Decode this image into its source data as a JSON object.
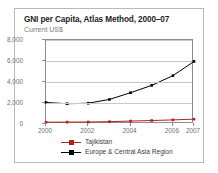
{
  "chart_data": {
    "type": "line",
    "title": "GNI per Capita, Atlas Method, 2000–07",
    "subtitle": "Current US$",
    "xlabel": "",
    "ylabel": "",
    "x": [
      2000,
      2001,
      2002,
      2003,
      2004,
      2005,
      2006,
      2007
    ],
    "xlim": [
      2000,
      2007
    ],
    "ylim": [
      0,
      8000
    ],
    "yticks": [
      0,
      2000,
      4000,
      6000,
      8000
    ],
    "ytick_labels": [
      "0",
      "2,000",
      "4,000",
      "6,000",
      "8,000"
    ],
    "xticks": [
      2000,
      2002,
      2004,
      2006,
      2007
    ],
    "xtick_labels": [
      "2000",
      "2002",
      "2004",
      "2006",
      "2007"
    ],
    "grid": true,
    "grid_axis": "y",
    "legend_position": "bottom",
    "marker": "square",
    "series": [
      {
        "name": "Tajikistan",
        "color": "#b02418",
        "marker": "square",
        "values": [
          170,
          180,
          190,
          220,
          280,
          330,
          390,
          460
        ]
      },
      {
        "name": "Europe & Central Asia Region",
        "color": "#000000",
        "marker": "square",
        "values": [
          2050,
          1930,
          1980,
          2340,
          2980,
          3680,
          4600,
          5960
        ]
      }
    ]
  },
  "legend": {
    "entries": [
      {
        "label": "Tajikistan",
        "color": "#b02418"
      },
      {
        "label": "Europe & Central Asia Region",
        "color": "#000000"
      }
    ]
  },
  "colors": {
    "frame_border": "#b9b9b9",
    "axis": "#8c8c8c",
    "gridline": "#c8c8c8",
    "title_text": "#1d1d1d",
    "subtitle_text": "#7a7a7a",
    "tick_text": "#6f6f6f",
    "background": "#ffffff"
  }
}
